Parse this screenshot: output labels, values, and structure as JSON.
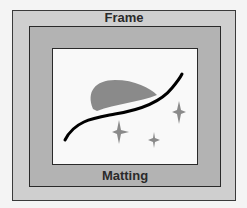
{
  "diagram": {
    "labels": {
      "frame": "Frame",
      "matting": "Matting"
    },
    "colors": {
      "frame": "#cfcfcf",
      "matting": "#b3b3b3",
      "picture": "#f9f9f9",
      "shape": "#8a8a8a",
      "line": "#000000"
    },
    "elements": [
      "outer frame",
      "matting",
      "picture with blob, curve and sparkles"
    ]
  }
}
